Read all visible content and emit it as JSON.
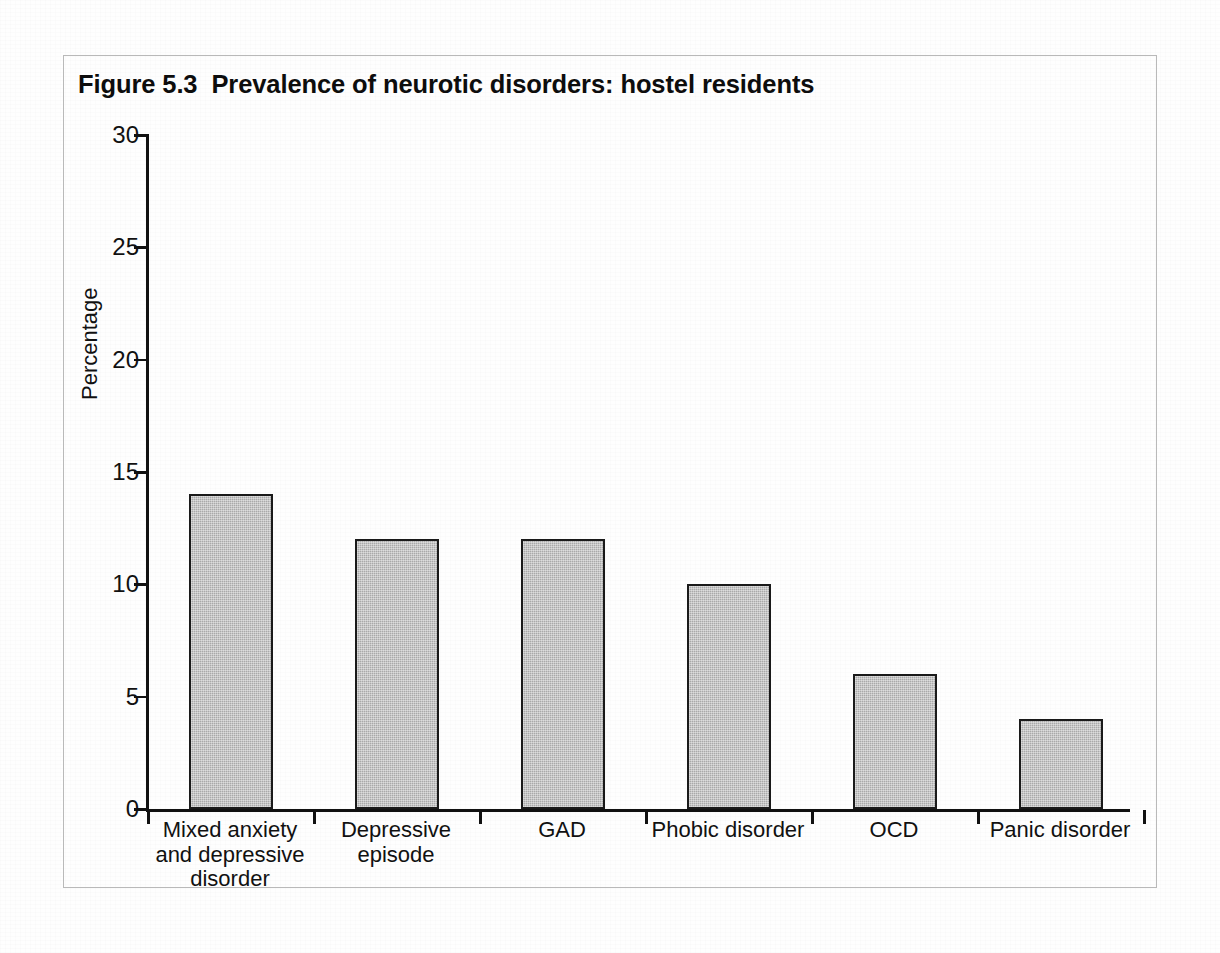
{
  "figure": {
    "title": "Figure 5.3  Prevalence of neurotic disorders: hostel residents",
    "frame_color": "#b9b9b9",
    "background_color": "#ffffff"
  },
  "chart_data": {
    "type": "bar",
    "title": "Figure 5.3  Prevalence of neurotic disorders: hostel residents",
    "xlabel": "",
    "ylabel": "Percentage",
    "ylim": [
      0,
      30
    ],
    "ytick_values": [
      0,
      5,
      10,
      15,
      20,
      25,
      30
    ],
    "ytick_labels": [
      "0",
      "5",
      "10",
      "15",
      "20",
      "25",
      "30"
    ],
    "grid": false,
    "legend": false,
    "bar_fill_color": "#a9a9a9",
    "bar_edge_color": "#1a1a1a",
    "categories": [
      "Mixed anxiety\nand depressive\ndisorder",
      "Depressive\nepisode",
      "GAD",
      "Phobic disorder",
      "OCD",
      "Panic disorder"
    ],
    "category_plain": [
      "Mixed anxiety and depressive disorder",
      "Depressive episode",
      "GAD",
      "Phobic disorder",
      "OCD",
      "Panic disorder"
    ],
    "values": [
      14,
      12,
      12,
      10,
      6,
      4
    ]
  }
}
